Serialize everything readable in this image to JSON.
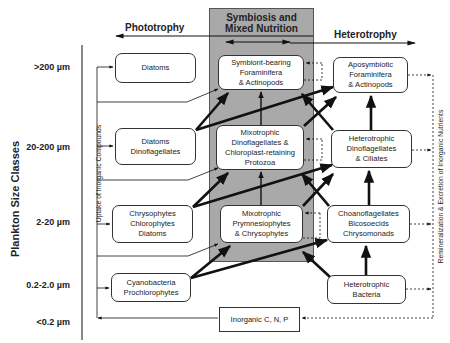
{
  "diagram": {
    "headers": {
      "phototrophy": "Phototrophy",
      "symbiosis_line1": "Symbiosis and",
      "symbiosis_line2": "Mixed Nutrition",
      "heterotrophy": "Heterotrophy"
    },
    "axis": {
      "title": "Plankton Size Classes",
      "classes": [
        ">200 µm",
        "20-200 µm",
        "2-20 µm",
        "0.2-2.0 µm",
        "<0.2 µm"
      ]
    },
    "side_labels": {
      "uptake": "Uptake of Inorganic  Compounds",
      "remineralization": "Remineralization & Excretion of Inorganic Nutrients"
    },
    "phototrophs": [
      {
        "lines": [
          "Diatoms"
        ]
      },
      {
        "lines": [
          "Diatoms",
          "Dinoflagellates"
        ]
      },
      {
        "lines": [
          "Chrysophytes",
          "Chlorophytes",
          "Diatoms"
        ]
      },
      {
        "lines": [
          "Cyanobacteria",
          "Prochlorophytes"
        ]
      }
    ],
    "mixotrophs": [
      {
        "lines": [
          "Symbiont-bearing",
          "Foraminifera",
          "& Actinopods"
        ]
      },
      {
        "lines": [
          "Mixotrophic",
          "Dinoflagellates &",
          "Chloroplast-retaining",
          "Protozoa"
        ]
      },
      {
        "lines": [
          "Mixotrophic",
          "Prymnesiophytes",
          "& Chrysophytes"
        ]
      }
    ],
    "heterotrophs": [
      {
        "lines": [
          "Aposymbiotic",
          "Foraminifera",
          "& Actinopods"
        ]
      },
      {
        "lines": [
          "Heterotrophic",
          "Dinoflagellates",
          "& Ciliates"
        ]
      },
      {
        "lines": [
          "Choanoflagellates",
          "Bicosoecids",
          "Chrysomonads"
        ]
      },
      {
        "lines": [
          "Heterotrophic",
          "Bacteria"
        ]
      }
    ],
    "inorganic": {
      "label": "Inorganic C, N, P"
    },
    "colors": {
      "mixed_nutrition_bg": "#a9a9a9",
      "line": "#111111",
      "box_border": "#333333"
    }
  }
}
